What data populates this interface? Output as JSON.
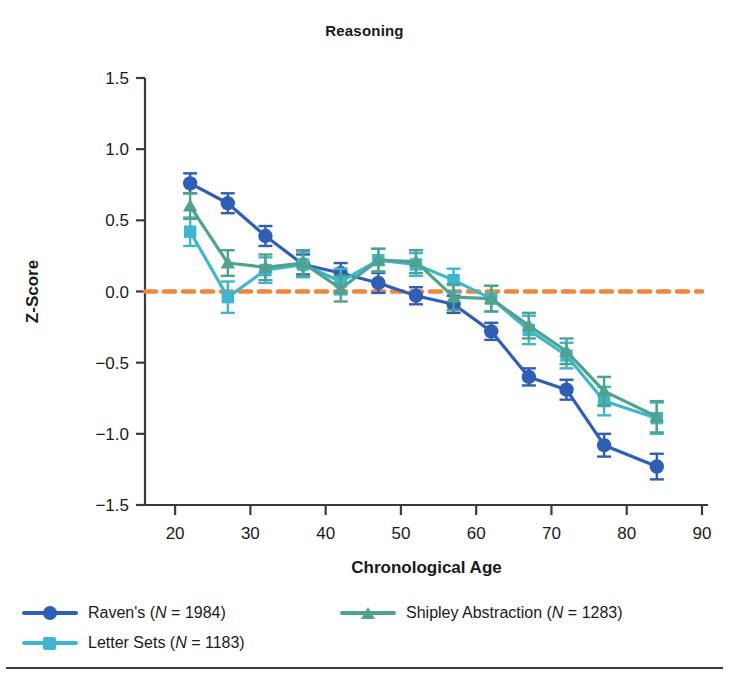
{
  "figure": {
    "title": "Reasoning",
    "bottom_rule": true
  },
  "axes": {
    "y_label": "Z-Score",
    "x_label": "Chronological Age",
    "y_ticks": [
      "1.5",
      "1.0",
      "0.5",
      "0.0",
      "-0.5",
      "-1.0",
      "-1.5"
    ],
    "x_ticks": [
      "20",
      "30",
      "40",
      "50",
      "60",
      "70",
      "80",
      "90"
    ],
    "reference_line_color": "#f0853c",
    "reference_line_value": "0.0"
  },
  "legend": {
    "entries": [
      {
        "label": "Raven's (N = 1984)",
        "name": "Raven's",
        "n": "1984",
        "color": "#2e5fb5",
        "marker": "circle"
      },
      {
        "label": "Letter Sets (N = 1183)",
        "name": "Letter Sets",
        "n": "1183",
        "color": "#3fb6cf",
        "marker": "square"
      },
      {
        "label": "Shipley Abstraction (N = 1283)",
        "name": "Shipley Abstraction",
        "n": "1283",
        "color": "#4fa28c",
        "marker": "triangle"
      }
    ]
  },
  "chart_data": {
    "type": "line",
    "title": "Reasoning",
    "xlabel": "Chronological Age",
    "ylabel": "Z-Score",
    "xlim": [
      16,
      90
    ],
    "ylim": [
      -1.5,
      1.5
    ],
    "grid": false,
    "legend_position": "bottom-left",
    "reference_lines": [
      {
        "axis": "y",
        "value": 0.0,
        "color": "#f0853c",
        "style": "dashed"
      }
    ],
    "x": [
      22,
      27,
      32,
      37,
      42,
      47,
      52,
      57,
      62,
      67,
      72,
      77,
      84
    ],
    "series": [
      {
        "name": "Raven's (N = 1984)",
        "color": "#2e5fb5",
        "marker": "circle",
        "values": [
          0.76,
          0.62,
          0.39,
          0.19,
          0.13,
          0.06,
          -0.03,
          -0.09,
          -0.28,
          -0.6,
          -0.69,
          -1.08,
          -1.23
        ],
        "errors": [
          0.07,
          0.07,
          0.07,
          0.07,
          0.07,
          0.07,
          0.06,
          0.06,
          0.06,
          0.06,
          0.07,
          0.08,
          0.09
        ]
      },
      {
        "name": "Letter Sets (N = 1183)",
        "color": "#3fb6cf",
        "marker": "square",
        "values": [
          0.42,
          -0.04,
          0.15,
          0.19,
          0.07,
          0.22,
          0.19,
          0.08,
          -0.05,
          -0.27,
          -0.45,
          -0.77,
          -0.89
        ],
        "errors": [
          0.1,
          0.11,
          0.09,
          0.09,
          0.09,
          0.08,
          0.08,
          0.08,
          0.09,
          0.1,
          0.09,
          0.1,
          0.11
        ]
      },
      {
        "name": "Shipley Abstraction (N = 1283)",
        "color": "#4fa28c",
        "marker": "triangle",
        "values": [
          0.6,
          0.2,
          0.17,
          0.2,
          0.02,
          0.22,
          0.21,
          -0.04,
          -0.05,
          -0.24,
          -0.42,
          -0.7,
          -0.88
        ],
        "errors": [
          0.09,
          0.09,
          0.09,
          0.09,
          0.09,
          0.08,
          0.08,
          0.09,
          0.09,
          0.09,
          0.09,
          0.1,
          0.11
        ]
      }
    ]
  }
}
